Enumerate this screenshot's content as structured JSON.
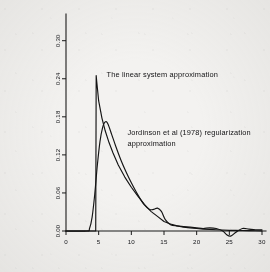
{
  "figure": {
    "background_color": "#f3f2f0",
    "ink_color": "#141414"
  },
  "chart_data": {
    "type": "line",
    "title": "",
    "subtitle": "",
    "xlabel": "",
    "ylabel": "",
    "xlim": [
      0,
      30
    ],
    "ylim": [
      0.0,
      0.32
    ],
    "grid": false,
    "legend_position": "in-plot annotations",
    "xticks": [
      0,
      5,
      10,
      15,
      20,
      25,
      30
    ],
    "xtick_labels": [
      "0",
      "5",
      "10",
      "15",
      "20",
      "25",
      "30"
    ],
    "yticks": [
      0.0,
      0.06,
      0.12,
      0.18,
      0.24,
      0.3
    ],
    "ytick_labels": [
      "0.00",
      "0.06",
      "0.12",
      "0.18",
      "0.24",
      "0.30"
    ],
    "ytick_rotation_degrees": 90,
    "series": [
      {
        "name": "The linear system approximation",
        "style": "sharp-peaked",
        "x": [
          0,
          3.4,
          4.4,
          4.55,
          4.62,
          4.7,
          5.0,
          5.5,
          6.0,
          6.6,
          7.2,
          8.0,
          9.0,
          10.0,
          11.0,
          12.0,
          13.0,
          14.0,
          15.0,
          16.0,
          17.0,
          18.0,
          19.0,
          20.0,
          21.0,
          22.0,
          23.0,
          24.0,
          25.0,
          26.0,
          27.0,
          28.0,
          29.0,
          30.0
        ],
        "y": [
          0.0,
          0.0,
          0.0,
          0.0,
          0.245,
          0.236,
          0.205,
          0.178,
          0.158,
          0.139,
          0.123,
          0.104,
          0.085,
          0.069,
          0.055,
          0.042,
          0.031,
          0.023,
          0.015,
          0.011,
          0.008,
          0.006,
          0.005,
          0.004,
          0.003,
          0.0025,
          0.002,
          0.0015,
          0.001,
          0.001,
          0.0008,
          0.0006,
          0.0004,
          0.0003
        ]
      },
      {
        "name": "Jordinson et al (1978) regularization approximation",
        "style": "smooth-broad",
        "x": [
          0,
          3.2,
          3.6,
          4.0,
          4.4,
          4.8,
          5.2,
          5.6,
          6.0,
          6.4,
          7.0,
          7.6,
          8.4,
          9.2,
          10.0,
          11.0,
          12.0,
          12.8,
          13.4,
          14.0,
          14.6,
          15.2,
          16.0,
          17.0,
          18.0,
          19.0,
          20.0,
          21.0,
          22.0,
          23.0,
          24.0,
          24.6,
          25.2,
          26.0,
          27.0,
          28.0,
          29.0,
          30.0
        ],
        "y": [
          0.0,
          0.0,
          0.004,
          0.022,
          0.058,
          0.104,
          0.141,
          0.163,
          0.172,
          0.169,
          0.152,
          0.134,
          0.112,
          0.093,
          0.076,
          0.057,
          0.041,
          0.034,
          0.034,
          0.036,
          0.031,
          0.018,
          0.01,
          0.008,
          0.007,
          0.006,
          0.005,
          0.004,
          0.005,
          0.004,
          0.0,
          -0.006,
          -0.008,
          -0.002,
          0.004,
          0.003,
          0.002,
          0.002
        ]
      }
    ],
    "annotations": [
      {
        "id": "annot-linear-system",
        "text": "The  linear  system  approximation",
        "x_data": 6.2,
        "y_data": 0.243
      },
      {
        "id": "annot-jordinson-line1",
        "text": "Jordinson et al  (1978) regularization",
        "x_data": 9.4,
        "y_data": 0.152
      },
      {
        "id": "annot-jordinson-line2",
        "text": "approximation",
        "x_data": 9.4,
        "y_data": 0.134
      }
    ]
  }
}
